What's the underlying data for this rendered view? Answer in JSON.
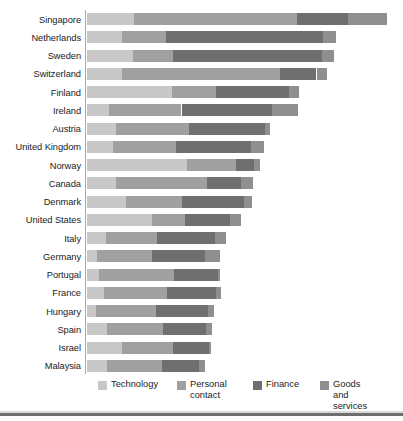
{
  "chart_data": {
    "type": "bar",
    "subtype": "stacked-horizontal",
    "title": "",
    "subtitle": "",
    "xlabel": "",
    "ylabel": "",
    "grid": false,
    "legend_position": "bottom",
    "xlim": [
      0,
      100
    ],
    "axis_ticks": [],
    "series": [
      {
        "name": "Technology",
        "color": "#c8c8c8"
      },
      {
        "name": "Personal\ncontact",
        "color": "#a0a0a0"
      },
      {
        "name": "Finance",
        "color": "#6f6f6f"
      },
      {
        "name": "Goods and\nservices",
        "color": "#8f8f8f"
      }
    ],
    "categories": [
      "Singapore",
      "Netherlands",
      "Sweden",
      "Switzerland",
      "Finland",
      "Ireland",
      "Austria",
      "United Kingdom",
      "Norway",
      "Canada",
      "Denmark",
      "United States",
      "Italy",
      "Germany",
      "Portugal",
      "France",
      "Hungary",
      "Spain",
      "Israel",
      "Malaysia"
    ],
    "values": [
      {
        "category": "Singapore",
        "Technology": 15.6,
        "Personal contact": 54.5,
        "Finance": 16.8,
        "Goods and services": 13.1,
        "total": 100.0
      },
      {
        "category": "Netherlands",
        "Technology": 11.8,
        "Personal contact": 14.6,
        "Finance": 52.3,
        "Goods and services": 4.3,
        "total": 83.0
      },
      {
        "category": "Sweden",
        "Technology": 15.2,
        "Personal contact": 13.5,
        "Finance": 49.5,
        "Goods and services": 4.0,
        "total": 82.2
      },
      {
        "category": "Switzerland",
        "Technology": 11.5,
        "Personal contact": 52.8,
        "Finance": 12.2,
        "Goods and services": 3.5,
        "total": 80.0
      },
      {
        "category": "Finland",
        "Technology": 28.4,
        "Personal contact": 14.6,
        "Finance": 24.4,
        "Goods and services": 3.4,
        "total": 70.8
      },
      {
        "category": "Ireland",
        "Technology": 7.3,
        "Personal contact": 24.2,
        "Finance": 30.0,
        "Goods and services": 8.7,
        "total": 70.2
      },
      {
        "category": "Austria",
        "Technology": 9.8,
        "Personal contact": 24.1,
        "Finance": 25.3,
        "Goods and services": 1.7,
        "total": 60.9
      },
      {
        "category": "United Kingdom",
        "Technology": 8.7,
        "Personal contact": 21.1,
        "Finance": 25.0,
        "Goods and services": 4.1,
        "total": 58.9
      },
      {
        "category": "Norway",
        "Technology": 33.2,
        "Personal contact": 16.5,
        "Finance": 6.1,
        "Goods and services": 1.9,
        "total": 57.7
      },
      {
        "category": "Canada",
        "Technology": 9.5,
        "Personal contact": 30.5,
        "Finance": 11.4,
        "Goods and services": 4.0,
        "total": 55.4
      },
      {
        "category": "Denmark",
        "Technology": 13.0,
        "Personal contact": 18.6,
        "Finance": 20.7,
        "Goods and services": 2.6,
        "total": 54.9
      },
      {
        "category": "United States",
        "Technology": 21.8,
        "Personal contact": 11.0,
        "Finance": 14.9,
        "Goods and services": 3.5,
        "total": 51.2
      },
      {
        "category": "Italy",
        "Technology": 6.2,
        "Personal contact": 17.0,
        "Finance": 19.5,
        "Goods and services": 3.7,
        "total": 46.4
      },
      {
        "category": "Germany",
        "Technology": 3.3,
        "Personal contact": 18.5,
        "Finance": 17.5,
        "Goods and services": 4.9,
        "total": 44.2
      },
      {
        "category": "Portugal",
        "Technology": 4.0,
        "Personal contact": 25.0,
        "Finance": 14.5,
        "Goods and services": 0.9,
        "total": 44.4
      },
      {
        "category": "France",
        "Technology": 5.8,
        "Personal contact": 21.0,
        "Finance": 16.2,
        "Goods and services": 1.5,
        "total": 44.5
      },
      {
        "category": "Hungary",
        "Technology": 3.0,
        "Personal contact": 20.0,
        "Finance": 17.3,
        "Goods and services": 2.0,
        "total": 42.3
      },
      {
        "category": "Spain",
        "Technology": 6.5,
        "Personal contact": 18.8,
        "Finance": 14.4,
        "Goods and services": 2.0,
        "total": 41.7
      },
      {
        "category": "Israel",
        "Technology": 11.5,
        "Personal contact": 17.3,
        "Finance": 11.8,
        "Goods and services": 0.8,
        "total": 41.4
      },
      {
        "category": "Malaysia",
        "Technology": 6.5,
        "Personal contact": 18.5,
        "Finance": 12.4,
        "Goods and services": 1.9,
        "total": 39.3
      }
    ]
  },
  "legend": {
    "items": [
      {
        "label": "Technology",
        "color": "#c8c8c8",
        "x": 98
      },
      {
        "label": "Personal\ncontact",
        "color": "#a0a0a0",
        "x": 177
      },
      {
        "label": "Finance",
        "color": "#6f6f6f",
        "x": 253
      },
      {
        "label": "Goods and\nservices",
        "color": "#8f8f8f",
        "x": 320
      }
    ]
  },
  "colors": {
    "technology": "#c8c8c8",
    "personal_contact": "#a0a0a0",
    "finance": "#6f6f6f",
    "goods_and_services": "#8f8f8f",
    "axis": "#a9a9a9",
    "text": "#1b1b1b",
    "rule": "#6e6e6e",
    "background": "#ffffff"
  }
}
